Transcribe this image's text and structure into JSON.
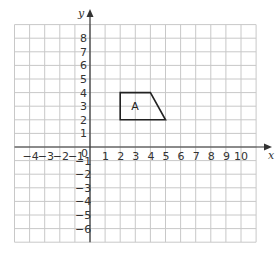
{
  "axes": {
    "x_label": "x",
    "y_label": "y",
    "origin_label": "0",
    "x_ticks": [
      {
        "value": -4,
        "label": "−4"
      },
      {
        "value": -3,
        "label": "−3"
      },
      {
        "value": -2,
        "label": "−2"
      },
      {
        "value": -1,
        "label": "−1"
      },
      {
        "value": 1,
        "label": "1"
      },
      {
        "value": 2,
        "label": "2"
      },
      {
        "value": 3,
        "label": "3"
      },
      {
        "value": 4,
        "label": "4"
      },
      {
        "value": 5,
        "label": "5"
      },
      {
        "value": 6,
        "label": "6"
      },
      {
        "value": 7,
        "label": "7"
      },
      {
        "value": 8,
        "label": "8"
      },
      {
        "value": 9,
        "label": "9"
      },
      {
        "value": 10,
        "label": "10"
      }
    ],
    "y_ticks": [
      {
        "value": 8,
        "label": "8"
      },
      {
        "value": 7,
        "label": "7"
      },
      {
        "value": 6,
        "label": "6"
      },
      {
        "value": 5,
        "label": "5"
      },
      {
        "value": 4,
        "label": "4"
      },
      {
        "value": 3,
        "label": "3"
      },
      {
        "value": 2,
        "label": "2"
      },
      {
        "value": 1,
        "label": "1"
      },
      {
        "value": -1,
        "label": "−1"
      },
      {
        "value": -2,
        "label": "−2"
      },
      {
        "value": -3,
        "label": "−3"
      },
      {
        "value": -4,
        "label": "−4"
      },
      {
        "value": -5,
        "label": "−5"
      },
      {
        "value": -6,
        "label": "−6"
      }
    ],
    "grid": {
      "x_min": -5,
      "x_max": 11,
      "y_min": -7,
      "y_max": 9
    }
  },
  "shape": {
    "label": "A",
    "vertices": [
      [
        2,
        2
      ],
      [
        2,
        4
      ],
      [
        4,
        4
      ],
      [
        5,
        2
      ]
    ],
    "stroke_color": "#222222"
  },
  "colors": {
    "grid": "#c8c8c8",
    "axis": "#333333"
  }
}
